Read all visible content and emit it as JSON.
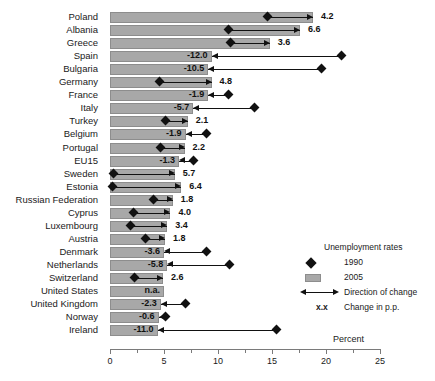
{
  "chart_data": {
    "type": "bar",
    "title": "",
    "xlabel": "Percent",
    "ylabel": "",
    "xlim": [
      0,
      25
    ],
    "xticks": [
      0,
      5,
      10,
      15,
      20,
      25
    ],
    "xtick_labels": [
      "0",
      "5",
      "10",
      "15",
      "20",
      "25"
    ],
    "grid": false,
    "legend_position": "inside-right",
    "categories": [
      "Poland",
      "Albania",
      "Greece",
      "Spain",
      "Bulgaria",
      "Germany",
      "France",
      "Italy",
      "Turkey",
      "Belgium",
      "Portugal",
      "EU15",
      "Sweden",
      "Estonia",
      "Russian Federation",
      "Cyprus",
      "Luxembourg",
      "Austria",
      "Denmark",
      "Netherlands",
      "Switzerland",
      "United States",
      "United Kingdom",
      "Norway",
      "Ireland"
    ],
    "series": [
      {
        "name": "2005",
        "values": [
          18.8,
          17.6,
          14.8,
          9.4,
          9.1,
          9.4,
          9.1,
          7.7,
          7.2,
          7.0,
          6.9,
          6.4,
          6.0,
          6.6,
          5.8,
          5.6,
          5.3,
          5.1,
          5.0,
          5.3,
          4.9,
          5.0,
          4.7,
          4.5,
          4.4
        ]
      },
      {
        "name": "1990",
        "values": [
          14.6,
          11.0,
          11.2,
          21.4,
          19.6,
          4.6,
          11.0,
          13.4,
          5.1,
          8.9,
          4.7,
          7.7,
          0.3,
          0.2,
          4.0,
          2.2,
          1.9,
          3.3,
          8.9,
          11.1,
          2.3,
          "n.a.",
          7.0,
          5.1,
          15.4
        ]
      }
    ],
    "change_labels": [
      "4.2",
      "6.6",
      "3.6",
      "-12.0",
      "-10.5",
      "4.8",
      "-1.9",
      "-5.7",
      "2.1",
      "-1.9",
      "2.2",
      "-1.3",
      "5.7",
      "6.4",
      "1.8",
      "4.0",
      "3.4",
      "1.8",
      "-3.6",
      "-5.8",
      "2.6",
      "n.a.",
      "-2.3",
      "-0.6",
      "-11.0"
    ],
    "change_values": [
      4.2,
      6.6,
      3.6,
      -12.0,
      -10.5,
      4.8,
      -1.9,
      -5.7,
      2.1,
      -1.9,
      2.2,
      -1.3,
      5.7,
      6.4,
      1.8,
      4.0,
      3.4,
      1.8,
      -3.6,
      -5.8,
      2.6,
      null,
      -2.3,
      -0.6,
      -11.0
    ],
    "colors": {
      "bar_fill": "#a8a8a8",
      "bar_stroke": "#8d8d8d",
      "marker": "#111111",
      "axis": "#7a7a7a"
    }
  },
  "legend": {
    "title": "Unemployment rates",
    "items": [
      {
        "label": "1990",
        "marker": "diamond-icon"
      },
      {
        "label": "2005",
        "marker": "bar-swatch-icon"
      },
      {
        "label": "Direction of change",
        "marker": "double-arrow-icon"
      },
      {
        "label": "Change in p.p.",
        "marker": "xx-symbol",
        "symbol": "x.x"
      }
    ]
  },
  "axis": {
    "unit_label": "Percent"
  }
}
